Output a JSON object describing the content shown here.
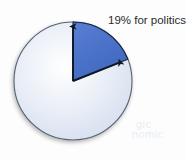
{
  "figure": {
    "label": "19% for politics",
    "background_color": "#fdfdfe"
  },
  "ghost_text": {
    "line1": "gic",
    "line2": "nomic"
  },
  "chart_data": {
    "type": "pie",
    "title": "19% for politics",
    "categories": [
      "politics",
      "other"
    ],
    "values": [
      19,
      81
    ],
    "labels": [
      "19% for politics",
      ""
    ],
    "colors": [
      "#4a72c8",
      "#dfe6f3"
    ],
    "start_angle_deg": 0,
    "direction": "clockwise",
    "annotations": [
      {
        "text": "19% for politics",
        "position": "top-right",
        "points_to": "politics-slice"
      }
    ],
    "legend": "none",
    "grid": false,
    "geometry": {
      "center_x": 73,
      "center_y": 81,
      "radius": 59,
      "slice_start_deg": 0,
      "slice_end_deg": 68.4
    },
    "markers": [
      {
        "name": "arrow-slice-start",
        "angle_deg": 0
      },
      {
        "name": "arrow-slice-end",
        "angle_deg": 68.4
      }
    ],
    "stroke_color": "#4a5568",
    "slice_edge_color": "#1b2740"
  }
}
